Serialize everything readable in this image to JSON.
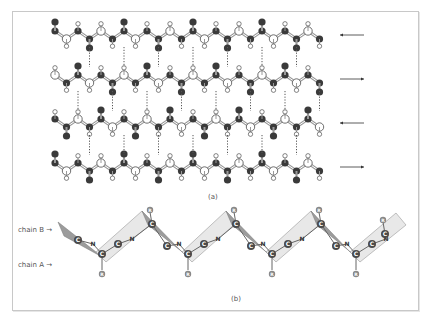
{
  "figure": {
    "part_a": {
      "caption": "(a)",
      "strand_count": 4,
      "strand_y": [
        35,
        79,
        123,
        167
      ],
      "directions": [
        "left",
        "right",
        "left",
        "right"
      ],
      "arrow_glyphs": [
        "←",
        "→",
        "←",
        "→"
      ],
      "atom_colors": {
        "carbon_oxygen": "#3a3a3a",
        "nitrogen": "#ffffff",
        "hydrogen": "#ffffff",
        "bond": "#9a9a9a",
        "hbond": "#555555"
      }
    },
    "part_b": {
      "caption": "(b)",
      "labels": {
        "chain_b": "chain B",
        "chain_a": "chain A"
      },
      "atom_labels": {
        "carbon": "C",
        "nitrogen": "N",
        "side_chain": "R"
      },
      "colors": {
        "pleat_light": "#e8e8e8",
        "pleat_dark": "#9c9c9c",
        "atom_fill": "#4a4a4a",
        "atom_text": "#ffffff"
      }
    }
  }
}
